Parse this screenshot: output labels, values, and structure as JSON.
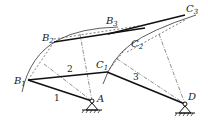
{
  "diagram": {
    "type": "four-bar linkage synthesis (three positions)",
    "points": {
      "B1": {
        "label": "B",
        "sub": "1"
      },
      "B2": {
        "label": "B",
        "sub": "2"
      },
      "B3": {
        "label": "B",
        "sub": "3"
      },
      "C1": {
        "label": "C",
        "sub": "1"
      },
      "C2": {
        "label": "C",
        "sub": "2"
      },
      "C3": {
        "label": "C",
        "sub": "3"
      },
      "A": {
        "label": "A"
      },
      "D": {
        "label": "D"
      }
    },
    "links": [
      {
        "id": "1",
        "label": "1",
        "from": "B1",
        "to": "A"
      },
      {
        "id": "2",
        "label": "2",
        "from": "B1",
        "to": "C1"
      },
      {
        "id": "3",
        "label": "3",
        "from": "C1",
        "to": "D"
      }
    ],
    "pivots": [
      "A",
      "D"
    ],
    "colors": {
      "line": "#1a1a1a",
      "background": "#ffffff"
    }
  }
}
